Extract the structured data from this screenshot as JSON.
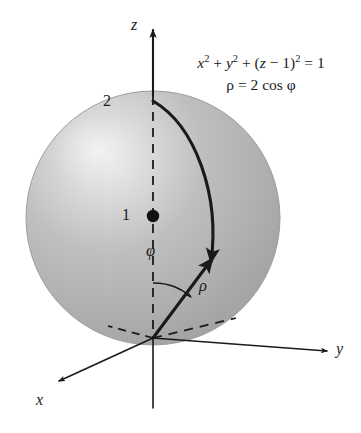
{
  "figure": {
    "background_color": "#ffffff",
    "ink_color": "#1a1a1a"
  },
  "equations": {
    "cartesian": {
      "parts": [
        "x",
        "2",
        " + ",
        "y",
        "2",
        " + (",
        "z",
        " − 1)",
        "2",
        " = 1"
      ],
      "plain": "x² + y² + (z − 1)² = 1"
    },
    "spherical": {
      "plain": "ρ = 2 cos φ",
      "rho_symbol": "ρ",
      "equals": "=",
      "coefficient": "2",
      "function": "cos",
      "phi_symbol": "φ"
    }
  },
  "axes": {
    "z": {
      "label": "z",
      "direction": "up",
      "tip": [
        153,
        28
      ]
    },
    "y": {
      "label": "y",
      "direction": "right-down",
      "tip": [
        330,
        352
      ]
    },
    "x": {
      "label": "x",
      "direction": "left-down",
      "tip": [
        57,
        383
      ]
    }
  },
  "markers": {
    "top_of_sphere": {
      "label": "2",
      "value": 2,
      "point": [
        153,
        101
      ]
    },
    "center_of_sphere": {
      "label": "1",
      "value": 1,
      "point": [
        153,
        216
      ],
      "dot": true
    }
  },
  "annotations": {
    "phi": {
      "label": "φ",
      "description": "polar angle from positive z-axis"
    },
    "rho": {
      "label": "ρ",
      "description": "radial distance from origin"
    }
  },
  "sphere": {
    "center": [
      153,
      218
    ],
    "radius": 127,
    "body_color": "#b2b2b2",
    "highlight_color": "#efefef",
    "edge_color": "#9a9a9a",
    "radius_value": 1,
    "center_coordinates": "(0, 0, 1)"
  },
  "colors": {
    "ink": "#1a1a1a",
    "sphere_fill": "#b2b2b2",
    "sphere_highlight": "#efefef",
    "axis_line": "#3a3a3a"
  }
}
